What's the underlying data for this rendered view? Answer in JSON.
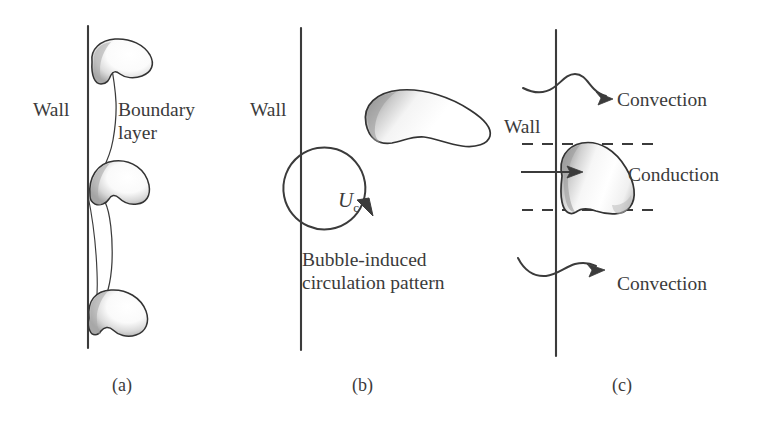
{
  "figure": {
    "background_color": "#ffffff",
    "ink_color": "#3b3b3b",
    "bubble_fill": "#ffffff",
    "bubble_shade": "#b9b9b9",
    "bubble_outline": "#333333"
  },
  "panels": [
    {
      "id": "a",
      "caption": "(a)",
      "description": "Bubbles growing on a wall distorting the thermal boundary layer",
      "labels": {
        "wall": "Wall",
        "boundary_line1": "Boundary",
        "boundary_line2": "layer"
      },
      "bubble_count": 3
    },
    {
      "id": "b",
      "caption": "(b)",
      "description": "Bubble-induced circulation next to the wall",
      "labels": {
        "wall": "Wall",
        "velocity_symbol": "U",
        "velocity_subscript": "c",
        "pattern_line1": "Bubble-induced",
        "pattern_line2": "circulation pattern"
      },
      "bubble_count": 1
    },
    {
      "id": "c",
      "caption": "(c)",
      "description": "Conduction through microlayer under the bubble and convection above and below",
      "labels": {
        "wall": "Wall",
        "convection_top": "Convection",
        "conduction": "Conduction",
        "convection_bottom": "Convection"
      },
      "bubble_count": 1
    }
  ],
  "icons": {
    "circulation_arrow": "circular-arrow-clockwise",
    "convection_arrow": "wavy-arrow-right",
    "conduction_arrow": "straight-arrow-right",
    "wall_line": "vertical-line",
    "boundary_layer": "curved-line",
    "microlayer_bounds": "dashed-horizontal-line"
  }
}
